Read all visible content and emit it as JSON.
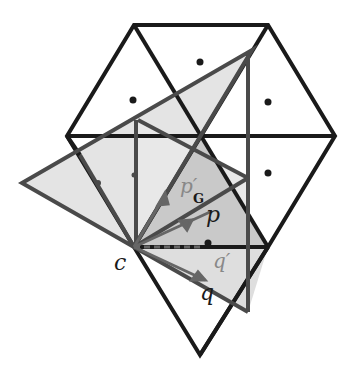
{
  "diagram": {
    "labels": {
      "c": "c",
      "p": "p",
      "p_prime_g": "p′",
      "p_prime_g_sub": "G",
      "q": "q",
      "q_prime": "q′"
    },
    "colors": {
      "grid_line": "#1a1a1a",
      "rotated_line": "#4a4a4a",
      "light_fill": "#e6e6e6",
      "mid_fill": "#c8c8c8",
      "label_dark": "#1a1a1a",
      "label_gray": "#777777"
    }
  }
}
